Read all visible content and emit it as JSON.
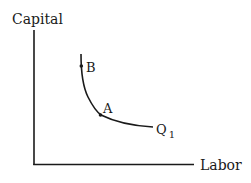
{
  "diagram": {
    "type": "isoquant",
    "y_axis_label": "Capital",
    "x_axis_label": "Labor",
    "curve_label": "Q",
    "curve_label_subscript": "1",
    "points": [
      {
        "id": "B",
        "label": "B"
      },
      {
        "id": "A",
        "label": "A"
      }
    ],
    "colors": {
      "ink": "#1a1a1a",
      "background": "#ffffff"
    }
  }
}
